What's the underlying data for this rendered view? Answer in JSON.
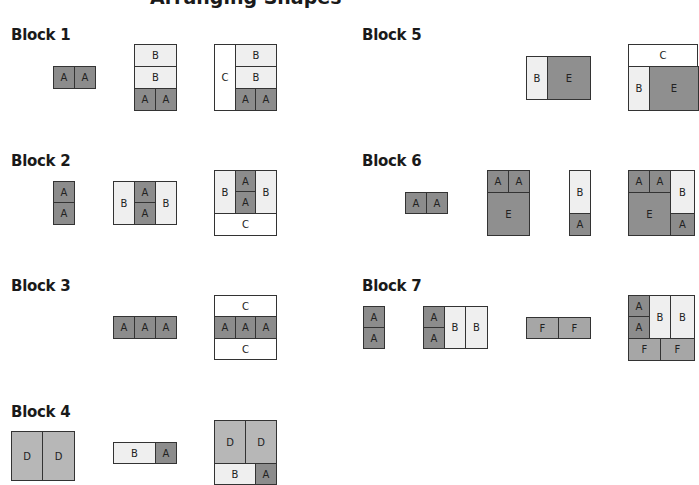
{
  "title_fragment": "Arranging Shapes",
  "colors": {
    "A": "#8c8c8c",
    "B": "#efefef",
    "C": "#ffffff",
    "D": "#b7b7b7",
    "E": "#8f8f8f",
    "F": "#a6a6a6",
    "border": "#333333"
  },
  "blocks": [
    {
      "label": "Block 1",
      "x": 11,
      "y": 26,
      "cells": [
        {
          "t": "A",
          "x": 53,
          "y": 66,
          "w": 22,
          "h": 23
        },
        {
          "t": "A",
          "x": 74,
          "y": 66,
          "w": 22,
          "h": 23
        },
        {
          "t": "B",
          "x": 134,
          "y": 44,
          "w": 43,
          "h": 23
        },
        {
          "t": "B",
          "x": 134,
          "y": 66,
          "w": 43,
          "h": 23
        },
        {
          "t": "A",
          "x": 134,
          "y": 88,
          "w": 22,
          "h": 23
        },
        {
          "t": "A",
          "x": 155,
          "y": 88,
          "w": 22,
          "h": 23
        },
        {
          "t": "C",
          "x": 214,
          "y": 44,
          "w": 22,
          "h": 67
        },
        {
          "t": "B",
          "x": 235,
          "y": 44,
          "w": 42,
          "h": 23
        },
        {
          "t": "B",
          "x": 235,
          "y": 66,
          "w": 42,
          "h": 23
        },
        {
          "t": "A",
          "x": 235,
          "y": 88,
          "w": 21,
          "h": 23
        },
        {
          "t": "A",
          "x": 255,
          "y": 88,
          "w": 22,
          "h": 23
        }
      ]
    },
    {
      "label": "Block 2",
      "x": 11,
      "y": 152,
      "cells": [
        {
          "t": "A",
          "x": 53,
          "y": 181,
          "w": 22,
          "h": 22
        },
        {
          "t": "A",
          "x": 53,
          "y": 202,
          "w": 22,
          "h": 23
        },
        {
          "t": "B",
          "x": 113,
          "y": 181,
          "w": 22,
          "h": 44
        },
        {
          "t": "A",
          "x": 134,
          "y": 181,
          "w": 22,
          "h": 22
        },
        {
          "t": "A",
          "x": 134,
          "y": 202,
          "w": 22,
          "h": 23
        },
        {
          "t": "B",
          "x": 155,
          "y": 181,
          "w": 22,
          "h": 44
        },
        {
          "t": "B",
          "x": 214,
          "y": 170,
          "w": 22,
          "h": 44
        },
        {
          "t": "A",
          "x": 235,
          "y": 170,
          "w": 21,
          "h": 22
        },
        {
          "t": "A",
          "x": 235,
          "y": 191,
          "w": 21,
          "h": 23
        },
        {
          "t": "B",
          "x": 255,
          "y": 170,
          "w": 22,
          "h": 44
        },
        {
          "t": "C",
          "x": 214,
          "y": 213,
          "w": 63,
          "h": 23
        }
      ]
    },
    {
      "label": "Block 3",
      "x": 11,
      "y": 277,
      "cells": [
        {
          "t": "A",
          "x": 113,
          "y": 316,
          "w": 22,
          "h": 23
        },
        {
          "t": "A",
          "x": 134,
          "y": 316,
          "w": 22,
          "h": 23
        },
        {
          "t": "A",
          "x": 155,
          "y": 316,
          "w": 22,
          "h": 23
        },
        {
          "t": "C",
          "x": 214,
          "y": 295,
          "w": 63,
          "h": 22
        },
        {
          "t": "A",
          "x": 214,
          "y": 316,
          "w": 22,
          "h": 23
        },
        {
          "t": "A",
          "x": 235,
          "y": 316,
          "w": 21,
          "h": 23
        },
        {
          "t": "A",
          "x": 255,
          "y": 316,
          "w": 22,
          "h": 23
        },
        {
          "t": "C",
          "x": 214,
          "y": 338,
          "w": 63,
          "h": 22
        }
      ]
    },
    {
      "label": "Block 4",
      "x": 11,
      "y": 403,
      "cells": [
        {
          "t": "D",
          "x": 11,
          "y": 431,
          "w": 32,
          "h": 50
        },
        {
          "t": "D",
          "x": 42,
          "y": 431,
          "w": 33,
          "h": 50
        },
        {
          "t": "B",
          "x": 113,
          "y": 442,
          "w": 43,
          "h": 22
        },
        {
          "t": "A",
          "x": 155,
          "y": 442,
          "w": 22,
          "h": 22
        },
        {
          "t": "D",
          "x": 214,
          "y": 420,
          "w": 32,
          "h": 44
        },
        {
          "t": "D",
          "x": 245,
          "y": 420,
          "w": 32,
          "h": 44
        },
        {
          "t": "B",
          "x": 214,
          "y": 463,
          "w": 42,
          "h": 22
        },
        {
          "t": "A",
          "x": 255,
          "y": 463,
          "w": 22,
          "h": 22
        }
      ]
    },
    {
      "label": "Block 5",
      "x": 362,
      "y": 26,
      "cells": [
        {
          "t": "B",
          "x": 526,
          "y": 56,
          "w": 22,
          "h": 44
        },
        {
          "t": "E",
          "x": 547,
          "y": 56,
          "w": 44,
          "h": 44
        },
        {
          "t": "C",
          "x": 628,
          "y": 44,
          "w": 70,
          "h": 23
        },
        {
          "t": "B",
          "x": 628,
          "y": 66,
          "w": 22,
          "h": 45
        },
        {
          "t": "E",
          "x": 649,
          "y": 66,
          "w": 50,
          "h": 45
        }
      ]
    },
    {
      "label": "Block 6",
      "x": 362,
      "y": 152,
      "cells": [
        {
          "t": "A",
          "x": 405,
          "y": 192,
          "w": 22,
          "h": 22
        },
        {
          "t": "A",
          "x": 426,
          "y": 192,
          "w": 22,
          "h": 22
        },
        {
          "t": "A",
          "x": 487,
          "y": 170,
          "w": 22,
          "h": 23
        },
        {
          "t": "A",
          "x": 508,
          "y": 170,
          "w": 22,
          "h": 23
        },
        {
          "t": "E",
          "x": 487,
          "y": 192,
          "w": 43,
          "h": 44
        },
        {
          "t": "B",
          "x": 569,
          "y": 170,
          "w": 22,
          "h": 44
        },
        {
          "t": "A",
          "x": 569,
          "y": 213,
          "w": 22,
          "h": 23
        },
        {
          "t": "A",
          "x": 628,
          "y": 170,
          "w": 22,
          "h": 23
        },
        {
          "t": "A",
          "x": 649,
          "y": 170,
          "w": 22,
          "h": 23
        },
        {
          "t": "E",
          "x": 628,
          "y": 192,
          "w": 43,
          "h": 44
        },
        {
          "t": "B",
          "x": 670,
          "y": 170,
          "w": 25,
          "h": 44
        },
        {
          "t": "A",
          "x": 670,
          "y": 213,
          "w": 25,
          "h": 23
        }
      ]
    },
    {
      "label": "Block 7",
      "x": 362,
      "y": 277,
      "cells": [
        {
          "t": "A",
          "x": 363,
          "y": 306,
          "w": 22,
          "h": 22
        },
        {
          "t": "A",
          "x": 363,
          "y": 327,
          "w": 22,
          "h": 22
        },
        {
          "t": "A",
          "x": 423,
          "y": 306,
          "w": 22,
          "h": 22
        },
        {
          "t": "A",
          "x": 423,
          "y": 327,
          "w": 22,
          "h": 22
        },
        {
          "t": "B",
          "x": 444,
          "y": 306,
          "w": 22,
          "h": 43
        },
        {
          "t": "B",
          "x": 465,
          "y": 306,
          "w": 23,
          "h": 43
        },
        {
          "t": "F",
          "x": 526,
          "y": 317,
          "w": 33,
          "h": 22
        },
        {
          "t": "F",
          "x": 558,
          "y": 317,
          "w": 33,
          "h": 22
        },
        {
          "t": "A",
          "x": 628,
          "y": 295,
          "w": 22,
          "h": 22
        },
        {
          "t": "A",
          "x": 628,
          "y": 316,
          "w": 22,
          "h": 23
        },
        {
          "t": "B",
          "x": 649,
          "y": 295,
          "w": 22,
          "h": 44
        },
        {
          "t": "B",
          "x": 670,
          "y": 295,
          "w": 25,
          "h": 44
        },
        {
          "t": "F",
          "x": 628,
          "y": 338,
          "w": 33,
          "h": 23
        },
        {
          "t": "F",
          "x": 660,
          "y": 338,
          "w": 35,
          "h": 23
        }
      ]
    }
  ]
}
